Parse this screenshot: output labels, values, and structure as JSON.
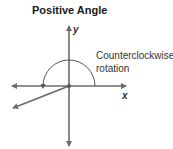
{
  "title": "Positive Angle",
  "axes": {
    "x_label": "x",
    "y_label": "y"
  },
  "annotation": {
    "line1": "Counterclockwise",
    "line2": "rotation"
  },
  "colors": {
    "line": "#6b6b6b",
    "text": "#333333",
    "title": "#1a1a1a"
  }
}
